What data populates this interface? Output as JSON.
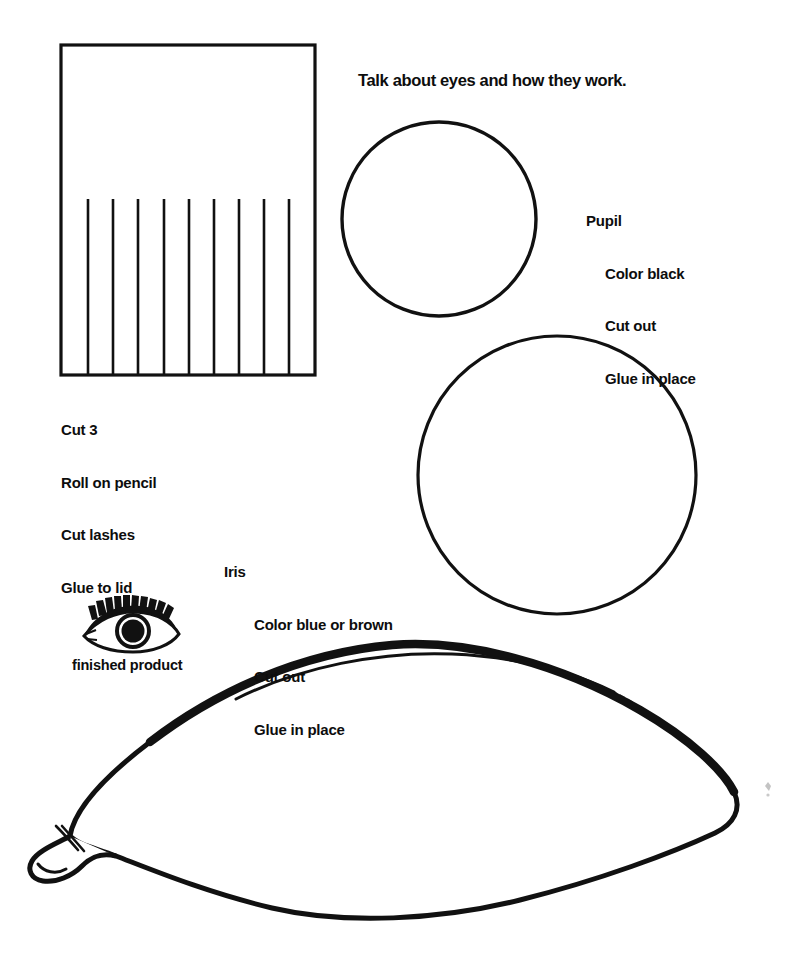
{
  "page": {
    "title": "Talk about eyes and how they work.",
    "background_color": "#ffffff",
    "ink_color": "#111111",
    "width": 787,
    "height": 955
  },
  "heading": {
    "text": "Talk about eyes and how they work."
  },
  "lashes_strip": {
    "shape_name": "eyelash-strip-rectangle",
    "cut_line_count": 9,
    "instructions": {
      "line1": "Cut 3",
      "line2": "Roll on pencil",
      "line3": "Cut lashes",
      "line4": "Glue to lid"
    }
  },
  "pupil": {
    "shape_name": "pupil-circle",
    "label": "Pupil",
    "instructions": {
      "line1": "Color black",
      "line2": "Cut out",
      "line3": "Glue in place"
    }
  },
  "iris": {
    "shape_name": "iris-circle",
    "label": "Iris",
    "instructions": {
      "line1": "Color blue or brown",
      "line2": "Cut out",
      "line3": "Glue in place"
    }
  },
  "finished_product": {
    "icon_name": "finished-eye-icon",
    "caption": "finished product"
  },
  "eye_outline": {
    "shape_name": "eye-lid-outline",
    "has_crease_line": true,
    "has_tear_duct": true
  }
}
